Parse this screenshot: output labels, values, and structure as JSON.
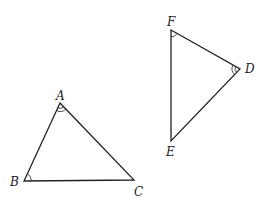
{
  "diagram": {
    "triangles": [
      {
        "name": "ABC",
        "vertices": [
          {
            "label": "A",
            "x": 60,
            "y": 103,
            "label_x": 56,
            "label_y": 100,
            "angle_mark": "double"
          },
          {
            "label": "B",
            "x": 24,
            "y": 181,
            "label_x": 10,
            "label_y": 186,
            "angle_mark": "single"
          },
          {
            "label": "C",
            "x": 134,
            "y": 180,
            "label_x": 134,
            "label_y": 196,
            "angle_mark": "none"
          }
        ]
      },
      {
        "name": "DEF",
        "vertices": [
          {
            "label": "F",
            "x": 171,
            "y": 30,
            "label_x": 167,
            "label_y": 26,
            "angle_mark": "single"
          },
          {
            "label": "D",
            "x": 240,
            "y": 69,
            "label_x": 245,
            "label_y": 73,
            "angle_mark": "double"
          },
          {
            "label": "E",
            "x": 171,
            "y": 141,
            "label_x": 166,
            "label_y": 156,
            "angle_mark": "none"
          }
        ]
      }
    ],
    "stroke_color": "#222222"
  }
}
